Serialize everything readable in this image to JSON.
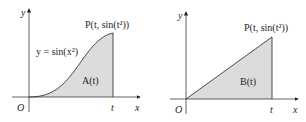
{
  "colors": {
    "fill": "#dcdcdc",
    "stroke": "#231f20",
    "axis": "#231f20"
  },
  "panels": [
    {
      "name": "left",
      "axis_x": "x",
      "axis_y": "y",
      "origin": "O",
      "t_label": "t",
      "point_label_prefix": "P",
      "point_label": "P(t, sin(t²))",
      "curve_label": "y = sin(x²)",
      "region_label": "A(t)"
    },
    {
      "name": "right",
      "axis_x": "x",
      "axis_y": "y",
      "origin": "O",
      "t_label": "t",
      "point_label": "P(t, sin(t²))",
      "region_label": "B(t)"
    }
  ]
}
